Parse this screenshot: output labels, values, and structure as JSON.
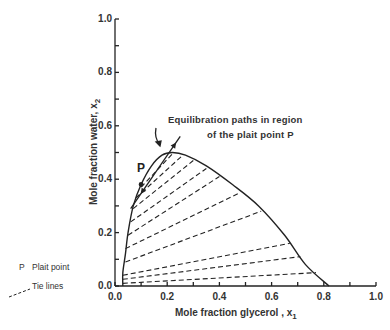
{
  "chart_data": {
    "type": "line",
    "title": "",
    "xlabel": "Mole fraction glycerol , x",
    "xlabel_sub": "1",
    "ylabel": "Mole fraction water, x",
    "ylabel_sub": "2",
    "xlim": [
      0.0,
      1.0
    ],
    "ylim": [
      0.0,
      1.0
    ],
    "grid": false,
    "x_ticks": [
      "0.0",
      "0.2",
      "0.4",
      "0.6",
      "0.8",
      "1.0"
    ],
    "y_ticks": [
      "0.0",
      "0.2",
      "0.4",
      "0.6",
      "0.8",
      "1.0"
    ],
    "series": [
      {
        "name": "Binodal curve",
        "style": "solid",
        "points": [
          [
            0.03,
            0.0
          ],
          [
            0.03,
            0.05
          ],
          [
            0.04,
            0.12
          ],
          [
            0.05,
            0.2
          ],
          [
            0.07,
            0.3
          ],
          [
            0.1,
            0.38
          ],
          [
            0.14,
            0.45
          ],
          [
            0.18,
            0.49
          ],
          [
            0.22,
            0.5
          ],
          [
            0.27,
            0.49
          ],
          [
            0.35,
            0.45
          ],
          [
            0.45,
            0.38
          ],
          [
            0.55,
            0.3
          ],
          [
            0.65,
            0.19
          ],
          [
            0.73,
            0.08
          ],
          [
            0.82,
            0.0
          ]
        ]
      },
      {
        "name": "Tie lines",
        "style": "dashed",
        "lines": [
          [
            [
              0.03,
              0.01
            ],
            [
              0.77,
              0.05
            ]
          ],
          [
            [
              0.03,
              0.025
            ],
            [
              0.71,
              0.11
            ]
          ],
          [
            [
              0.03,
              0.04
            ],
            [
              0.67,
              0.16
            ]
          ],
          [
            [
              0.04,
              0.09
            ],
            [
              0.56,
              0.28
            ]
          ],
          [
            [
              0.04,
              0.14
            ],
            [
              0.48,
              0.35
            ]
          ],
          [
            [
              0.05,
              0.19
            ],
            [
              0.4,
              0.41
            ]
          ],
          [
            [
              0.06,
              0.24
            ],
            [
              0.35,
              0.44
            ]
          ],
          [
            [
              0.07,
              0.29
            ],
            [
              0.3,
              0.47
            ]
          ],
          [
            [
              0.08,
              0.33
            ],
            [
              0.26,
              0.49
            ]
          ],
          [
            [
              0.1,
              0.37
            ],
            [
              0.22,
              0.495
            ]
          ]
        ]
      },
      {
        "name": "Equilibration path",
        "style": "solid-arrow",
        "points": [
          [
            0.06,
            0.29
          ],
          [
            0.25,
            0.56
          ]
        ]
      }
    ],
    "annotations": [
      {
        "text": "Equilibration paths in region",
        "x": 0.25,
        "y": 0.6
      },
      {
        "text": "of the plait point P",
        "x": 0.35,
        "y": 0.56
      },
      {
        "text": "P",
        "x": 0.1,
        "y": 0.42
      }
    ],
    "legend": [
      {
        "symbol": "P",
        "label": "Plait point"
      },
      {
        "symbol": "dashed-line",
        "label": "Tie lines"
      }
    ],
    "legend_position": "lower-left"
  }
}
